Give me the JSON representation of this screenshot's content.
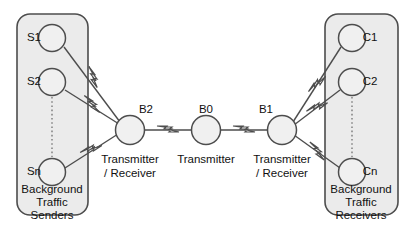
{
  "diagram": {
    "colors": {
      "background": "#ffffff",
      "group_fill": "#ebebeb",
      "node_fill": "#f0f0f0",
      "stroke": "#4d4d4d",
      "text": "#111111"
    },
    "groups": [
      {
        "id": "senders",
        "label_line1": "Background",
        "label_line2": "Traffic",
        "label_line3": "Senders",
        "nodes": [
          {
            "id": "s1",
            "label": "S1"
          },
          {
            "id": "s2",
            "label": "S2"
          },
          {
            "id": "sn",
            "label": "Sn"
          }
        ]
      },
      {
        "id": "receivers",
        "label_line1": "Background",
        "label_line2": "Traffic",
        "label_line3": "Receivers",
        "nodes": [
          {
            "id": "c1",
            "label": "C1"
          },
          {
            "id": "c2",
            "label": "C2"
          },
          {
            "id": "cn",
            "label": "Cn"
          }
        ]
      }
    ],
    "backbone_nodes": [
      {
        "id": "b2",
        "label": "B2",
        "caption_line1": "Transmitter",
        "caption_line2": "/ Receiver"
      },
      {
        "id": "b0",
        "label": "B0",
        "caption_line1": "Transmitter",
        "caption_line2": ""
      },
      {
        "id": "b1",
        "label": "B1",
        "caption_line1": "Transmitter",
        "caption_line2": "/ Receiver"
      }
    ],
    "links": [
      {
        "id": "s1-b2",
        "from": "S1",
        "to": "B2",
        "type": "wireless"
      },
      {
        "id": "s2-b2",
        "from": "S2",
        "to": "B2",
        "type": "wireless"
      },
      {
        "id": "sn-b2",
        "from": "Sn",
        "to": "B2",
        "type": "wireless"
      },
      {
        "id": "b2-b0",
        "from": "B2",
        "to": "B0",
        "type": "wireless"
      },
      {
        "id": "b0-b1",
        "from": "B0",
        "to": "B1",
        "type": "wireless"
      },
      {
        "id": "b1-c1",
        "from": "B1",
        "to": "C1",
        "type": "wireless"
      },
      {
        "id": "b1-c2",
        "from": "B1",
        "to": "C2",
        "type": "wireless"
      },
      {
        "id": "b1-cn",
        "from": "B1",
        "to": "Cn",
        "type": "wireless"
      }
    ]
  }
}
